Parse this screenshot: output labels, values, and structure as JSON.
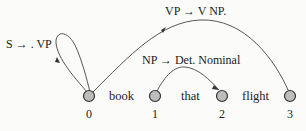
{
  "diagram": {
    "type": "chart-parser-edges",
    "nodes": [
      {
        "id": 0,
        "label": "0"
      },
      {
        "id": 1,
        "label": "1"
      },
      {
        "id": 2,
        "label": "2"
      },
      {
        "id": 3,
        "label": "3"
      }
    ],
    "words": [
      "book",
      "that",
      "flight"
    ],
    "edges": [
      {
        "from": 0,
        "to": 0,
        "label": "S → . VP"
      },
      {
        "from": 0,
        "to": 3,
        "label": "VP → V NP."
      },
      {
        "from": 1,
        "to": 2,
        "label": "NP → Det. Nominal"
      }
    ]
  }
}
